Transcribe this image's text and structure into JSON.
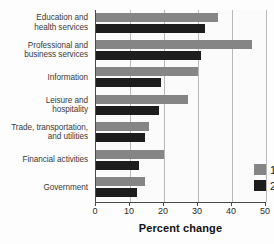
{
  "chart_data": {
    "type": "bar",
    "orientation": "horizontal",
    "title": "",
    "xlabel": "Percent change",
    "ylabel": "",
    "xlim": [
      0,
      50
    ],
    "xticks": [
      "0",
      "10",
      "20",
      "30",
      "40",
      "50"
    ],
    "grid": true,
    "legend_position": "inside-bottom-right",
    "categories": [
      "Education and health services",
      "Professional and business services",
      "Information",
      "Leisure and hospitality",
      "Trade, transportation, and utilities",
      "Financial activities",
      "Government"
    ],
    "category_lines": [
      [
        "Education and",
        "health services"
      ],
      [
        "Professional and",
        "business services"
      ],
      [
        "Information"
      ],
      [
        "Leisure and",
        "hospitality"
      ],
      [
        "Trade, transportation,",
        "and utilities"
      ],
      [
        "Financial activities"
      ],
      [
        "Government"
      ]
    ],
    "series": [
      {
        "name": "1992–2002",
        "color": "#858585",
        "values": [
          36,
          46,
          30,
          27,
          15.5,
          20,
          14.5
        ]
      },
      {
        "name": "2002–2012",
        "color": "#1d1d1d",
        "values": [
          32,
          31,
          19,
          18.5,
          14.5,
          12.5,
          12
        ]
      }
    ]
  },
  "legend": {
    "items": [
      {
        "label": "1992–2002",
        "color": "#858585"
      },
      {
        "label": "2002–2012",
        "color": "#1d1d1d"
      }
    ]
  },
  "axis": {
    "x_label": "Percent change",
    "ticks": [
      "0",
      "10",
      "20",
      "30",
      "40",
      "50"
    ]
  }
}
